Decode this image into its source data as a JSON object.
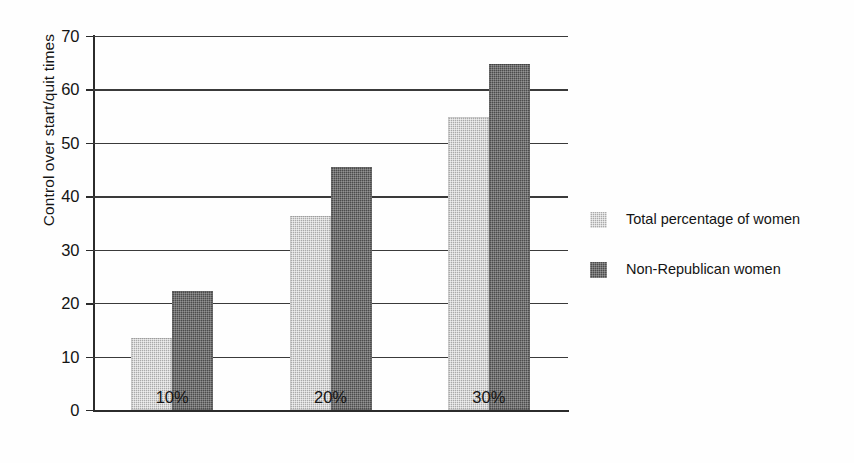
{
  "chart_data": {
    "type": "bar",
    "title": "",
    "subtitle": "",
    "xlabel": "",
    "ylabel": "Control over start/quit times",
    "categories": [
      "10%",
      "20%",
      "30%"
    ],
    "series": [
      {
        "name": "Total percentage of women",
        "color": "#aaaaaa",
        "values": [
          13.5,
          36.3,
          54.8
        ]
      },
      {
        "name": "Non-Republican women",
        "color": "#4c4c4c",
        "values": [
          22.2,
          45.5,
          64.7
        ]
      }
    ],
    "ylim": [
      0,
      70
    ],
    "ytick_labels": [
      "0",
      "10",
      "20",
      "30",
      "40",
      "50",
      "60",
      "70"
    ],
    "ytick_values": [
      0,
      10,
      20,
      30,
      40,
      50,
      60,
      70
    ],
    "grid": "horizontal",
    "legend_position": "right",
    "annotations": []
  },
  "legend": {
    "entries": [
      {
        "label": "Total percentage of women",
        "swatch": "light-gray-swatch-icon"
      },
      {
        "label": "Non-Republican women",
        "swatch": "dark-gray-swatch-icon"
      }
    ]
  }
}
